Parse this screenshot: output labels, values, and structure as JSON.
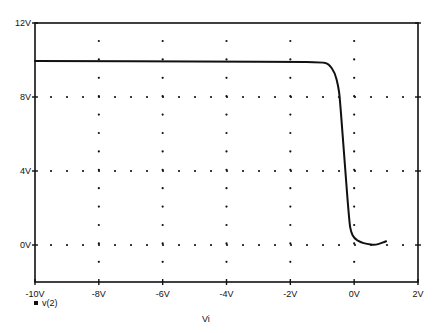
{
  "chart_data": {
    "type": "line",
    "title": "",
    "xlabel": "Vi",
    "ylabel": "",
    "xlim": [
      -10,
      2
    ],
    "ylim": [
      -2,
      12
    ],
    "grid": "dotted",
    "x_ticks": [
      -10,
      -8,
      -6,
      -4,
      -2,
      0,
      2
    ],
    "x_tick_labels": [
      "-10V",
      "-8V",
      "-6V",
      "-4V",
      "-2V",
      "0V",
      "2V"
    ],
    "y_ticks": [
      0,
      4,
      8,
      12
    ],
    "y_tick_labels": [
      "0V",
      "4V",
      "8V",
      "12V"
    ],
    "legend": {
      "position": "bottom-left",
      "entries": [
        "v(2)"
      ]
    },
    "series": [
      {
        "name": "v(2)",
        "x": [
          -10,
          -8,
          -6,
          -4,
          -2,
          -1,
          -0.8,
          -0.6,
          -0.5,
          -0.45,
          -0.3,
          -0.15,
          -0.1,
          0.0,
          0.2,
          0.4,
          0.65,
          0.85,
          1.0
        ],
        "y": [
          9.95,
          9.94,
          9.93,
          9.92,
          9.9,
          9.88,
          9.8,
          9.3,
          8.6,
          8.0,
          4.5,
          1.2,
          0.7,
          0.35,
          0.15,
          0.05,
          0.0,
          0.1,
          0.2
        ]
      }
    ]
  },
  "labels": {
    "legend_label": "v(2)",
    "xlabel": "Vi"
  }
}
